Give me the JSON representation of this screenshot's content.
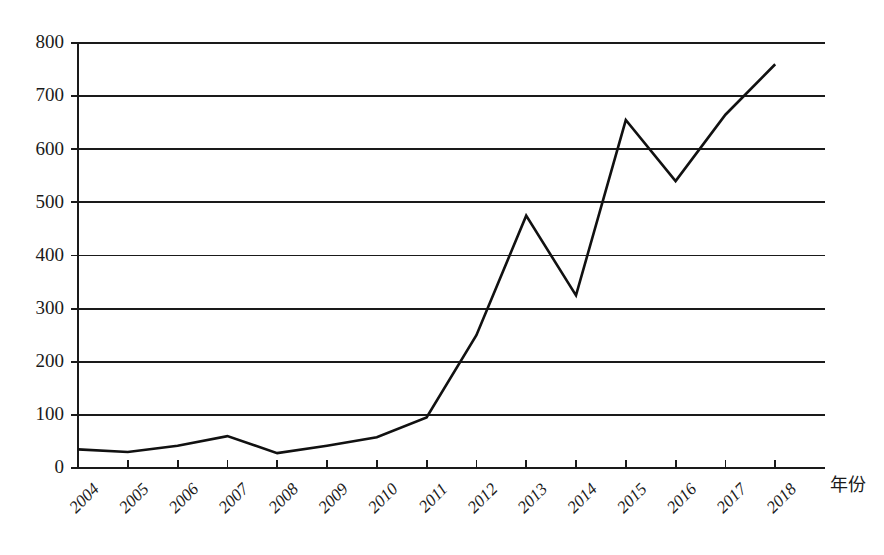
{
  "chart_data": {
    "type": "line",
    "title": "",
    "subtitle": "",
    "xlabel": "年份",
    "ylabel": "",
    "categories": [
      "2004",
      "2005",
      "2006",
      "2007",
      "2008",
      "2009",
      "2010",
      "2011",
      "2012",
      "2013",
      "2014",
      "2015",
      "2016",
      "2017",
      "2018"
    ],
    "values": [
      35,
      30,
      42,
      60,
      28,
      42,
      58,
      95,
      250,
      475,
      325,
      655,
      540,
      665,
      760
    ],
    "series": [
      {
        "name": "",
        "values": [
          35,
          30,
          42,
          60,
          28,
          42,
          58,
          95,
          250,
          475,
          325,
          655,
          540,
          665,
          760
        ]
      }
    ],
    "xlim": [
      "2004",
      "2018"
    ],
    "ylim": [
      0,
      800
    ],
    "ytick_values": [
      0,
      100,
      200,
      300,
      400,
      500,
      600,
      700,
      800
    ],
    "ytick_labels": [
      "0",
      "100",
      "200",
      "300",
      "400",
      "500",
      "600",
      "700",
      "800"
    ],
    "xtick_labels": [
      "2004",
      "2005",
      "2006",
      "2007",
      "2008",
      "2009",
      "2010",
      "2011",
      "2012",
      "2013",
      "2014",
      "2015",
      "2016",
      "2017",
      "2018"
    ],
    "grid": "horizontal",
    "legend": "none",
    "line_color": "#111111",
    "grid_color": "#1a1a1a",
    "background_color": "#ffffff",
    "xtick_label_rotation": -45,
    "annotations": []
  },
  "axis": {
    "x_axis_title": "年份"
  }
}
